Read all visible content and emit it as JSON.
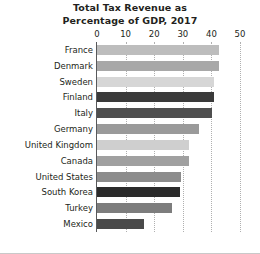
{
  "chart_data": {
    "type": "bar",
    "orientation": "horizontal",
    "title": "Total Tax Revenue as Percentage of GDP, 2017",
    "title_lines": [
      "Total Tax Revenue as",
      "Percentage of GDP, 2017"
    ],
    "xlabel": "",
    "ylabel": "",
    "xlim": [
      0,
      50
    ],
    "xticks": [
      0,
      10,
      20,
      30,
      40,
      50
    ],
    "xtick_labels": [
      "0",
      "10",
      "20",
      "30",
      "40",
      "50"
    ],
    "grid": "vertical-dotted",
    "legend": "none",
    "categories": [
      "France",
      "Denmark",
      "Sweden",
      "Finland",
      "Italy",
      "Germany",
      "United Kingdom",
      "Canada",
      "United States",
      "South Korea",
      "Turkey",
      "Mexico"
    ],
    "values": [
      42.6,
      42.5,
      41.0,
      40.9,
      40.1,
      35.6,
      32.3,
      32.1,
      29.2,
      29.0,
      26.3,
      16.4
    ],
    "bar_colors": [
      "#bdbdbd",
      "#a8a8a8",
      "#d6d6d6",
      "#3a3a3a",
      "#4f4f4f",
      "#9a9a9a",
      "#cfcfcf",
      "#a0a0a0",
      "#8c8c8c",
      "#2b2b2b",
      "#7d7d7d",
      "#4a4a4a"
    ]
  },
  "colors": {
    "axis": "#58595b",
    "grid": "#b0b0b0",
    "text": "#231f20",
    "background": "#ffffff",
    "frame": "#c9c9c9"
  }
}
